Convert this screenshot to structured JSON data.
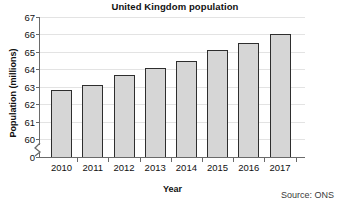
{
  "chart_data": {
    "type": "bar",
    "title": "United Kingdom population",
    "xlabel": "Year",
    "ylabel": "Population (millions)",
    "categories": [
      "2010",
      "2011",
      "2012",
      "2013",
      "2014",
      "2015",
      "2016",
      "2017"
    ],
    "values": [
      62.8,
      63.1,
      63.7,
      64.1,
      64.5,
      65.1,
      65.5,
      66.0
    ],
    "ylim": [
      60,
      67
    ],
    "ytick_labels": [
      "0",
      "60",
      "61",
      "62",
      "63",
      "64",
      "65",
      "66",
      "67"
    ],
    "axis_break": true,
    "grid": true,
    "legend": "none",
    "bar_fill_color": "#d6d6d6",
    "bar_edge_color": "#2e2e2e",
    "gridline_color": "#e3e3e3",
    "axis_color": "#6a6a6a",
    "annotation": "Source: ONS"
  }
}
